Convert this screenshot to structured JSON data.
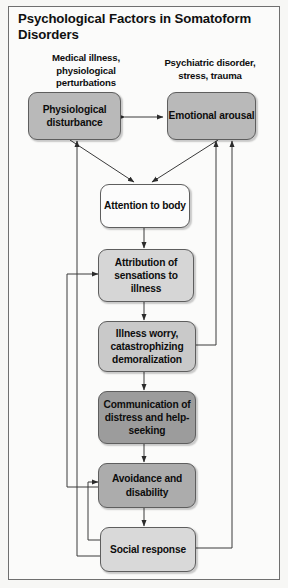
{
  "figure": {
    "title": "Psychological Factors in Somatoform Disorders",
    "background_color": "#fbfbfa",
    "border_color": "#6f6f6f"
  },
  "captions": [
    {
      "id": "caption-medical",
      "text": "Medical illness, physiological perturbations"
    },
    {
      "id": "caption-psychiatric",
      "text": "Psychiatric disorder, stress, trauma"
    }
  ],
  "nodes": [
    {
      "id": "physiological-disturbance",
      "label": "Physiological disturbance",
      "fill": "#b9b9b9"
    },
    {
      "id": "emotional-arousal",
      "label": "Emotional arousal",
      "fill": "#b9b9b9"
    },
    {
      "id": "attention-to-body",
      "label": "Attention to body",
      "fill": "#fcfcfc"
    },
    {
      "id": "attribution-of-sensations",
      "label": "Attribution of sensations to illness",
      "fill": "#d6d6d6"
    },
    {
      "id": "illness-worry",
      "label": "Illness worry, catastrophizing demoralization",
      "fill": "#c9c9c9"
    },
    {
      "id": "communication-of-distress",
      "label": "Communication of distress and help-seeking",
      "fill": "#9c9c9c"
    },
    {
      "id": "avoidance-and-disability",
      "label": "Avoidance and disability",
      "fill": "#acacac"
    },
    {
      "id": "social-response",
      "label": "Social response",
      "fill": "#d9d9d9"
    }
  ],
  "edges": [
    {
      "id": "edge-physiological-emotional",
      "from": "physiological-disturbance",
      "to": "emotional-arousal",
      "kind": "bidirectional"
    },
    {
      "id": "edge-physiological-attention",
      "from": "physiological-disturbance",
      "to": "attention-to-body",
      "kind": "directed"
    },
    {
      "id": "edge-emotional-attention",
      "from": "emotional-arousal",
      "to": "attention-to-body",
      "kind": "directed"
    },
    {
      "id": "edge-attention-attribution",
      "from": "attention-to-body",
      "to": "attribution-of-sensations",
      "kind": "directed"
    },
    {
      "id": "edge-attribution-worry",
      "from": "attribution-of-sensations",
      "to": "illness-worry",
      "kind": "directed"
    },
    {
      "id": "edge-worry-communication",
      "from": "illness-worry",
      "to": "communication-of-distress",
      "kind": "directed"
    },
    {
      "id": "edge-communication-avoidance",
      "from": "communication-of-distress",
      "to": "avoidance-and-disability",
      "kind": "directed"
    },
    {
      "id": "edge-avoidance-social",
      "from": "avoidance-and-disability",
      "to": "social-response",
      "kind": "directed"
    },
    {
      "id": "edge-worry-emotional-feedback",
      "from": "illness-worry",
      "to": "emotional-arousal",
      "kind": "feedback-right"
    },
    {
      "id": "edge-social-emotional-feedback",
      "from": "social-response",
      "to": "emotional-arousal",
      "kind": "feedback-right"
    },
    {
      "id": "edge-social-physiological-feedback",
      "from": "social-response",
      "to": "physiological-disturbance",
      "kind": "feedback-left"
    },
    {
      "id": "edge-avoidance-attribution-feedback",
      "from": "avoidance-and-disability",
      "to": "attribution-of-sensations",
      "kind": "feedback-left"
    },
    {
      "id": "edge-social-avoidance-feedback",
      "from": "social-response",
      "to": "avoidance-and-disability",
      "kind": "feedback-left"
    }
  ]
}
